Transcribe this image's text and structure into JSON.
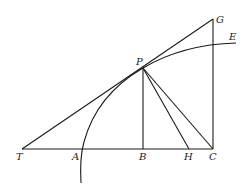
{
  "diagram": {
    "type": "geometric construction",
    "colors": {
      "ink": "#1a1a1a",
      "background": "#ffffff"
    },
    "points": {
      "T": {
        "label": "T",
        "x": 22,
        "y": 149
      },
      "A": {
        "label": "A",
        "x": 83,
        "y": 149
      },
      "B": {
        "label": "B",
        "x": 143,
        "y": 149
      },
      "H": {
        "label": "H",
        "x": 189,
        "y": 149
      },
      "C": {
        "label": "C",
        "x": 213,
        "y": 149
      },
      "P": {
        "label": "P",
        "x": 143,
        "y": 68
      },
      "G": {
        "label": "G",
        "x": 213,
        "y": 19
      },
      "E": {
        "label": "E",
        "x": 235,
        "y": 43
      }
    },
    "segments": [
      "T-C",
      "T-G",
      "P-B",
      "P-H",
      "P-C",
      "C-G"
    ],
    "curve": {
      "name": "curve through A, P, E",
      "passes_through": [
        "A",
        "P",
        "E"
      ]
    }
  }
}
